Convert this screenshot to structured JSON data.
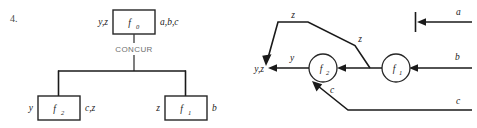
{
  "figure": {
    "item_number": "4.",
    "left_diagram": {
      "name": "concur-tree",
      "operator_label": "CONCUR",
      "root": {
        "node_label": "f",
        "node_subscript": "0",
        "left_label": "y,z",
        "right_label": "a,b,c"
      },
      "children": [
        {
          "node_label": "f",
          "node_subscript": "2",
          "left_label": "y",
          "right_label": "c,z"
        },
        {
          "node_label": "f",
          "node_subscript": "1",
          "left_label": "z",
          "right_label": "b"
        }
      ]
    },
    "right_diagram": {
      "name": "dataflow-network",
      "nodes": [
        {
          "node_label": "f",
          "node_subscript": "2"
        },
        {
          "node_label": "f",
          "node_subscript": "1"
        }
      ],
      "inputs": [
        {
          "label": "a"
        },
        {
          "label": "b"
        },
        {
          "label": "c"
        }
      ],
      "outputs": [
        {
          "label": "y,z"
        }
      ],
      "edge_labels": [
        {
          "label": "z",
          "position": "top"
        },
        {
          "label": "z",
          "position": "right-diagonal"
        },
        {
          "label": "y",
          "position": "output-wire"
        },
        {
          "label": "c",
          "position": "lower-diagonal"
        }
      ]
    }
  },
  "colors": {
    "ink": "#1a1a1a",
    "stroke": "#262626",
    "muted": "#6f6f6f",
    "item_number": "#4a4a4a",
    "background": "#ffffff"
  }
}
